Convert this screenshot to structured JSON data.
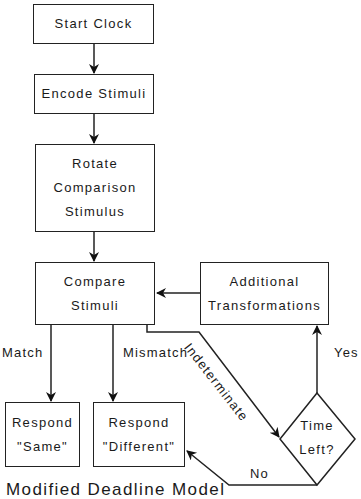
{
  "diagram": {
    "nodes": {
      "start_clock": {
        "lines": [
          "Start Clock"
        ]
      },
      "encode_stimuli": {
        "lines": [
          "Encode Stimuli"
        ]
      },
      "rotate": {
        "lines": [
          "Rotate",
          "Comparison",
          "Stimulus"
        ]
      },
      "compare": {
        "lines": [
          "Compare",
          "Stimuli"
        ]
      },
      "additional": {
        "lines": [
          "Additional",
          "Transformations"
        ]
      },
      "respond_same": {
        "lines": [
          "Respond",
          "\"Same\""
        ]
      },
      "respond_different": {
        "lines": [
          "Respond",
          "\"Different\""
        ]
      },
      "time_left": {
        "lines": [
          "Time",
          "Left?"
        ]
      }
    },
    "edge_labels": {
      "match": "Match",
      "mismatch": "Mismatch",
      "indeterminate": "Indeterminate",
      "yes": "Yes",
      "no": "No"
    },
    "caption": "Modified Deadline Model"
  }
}
